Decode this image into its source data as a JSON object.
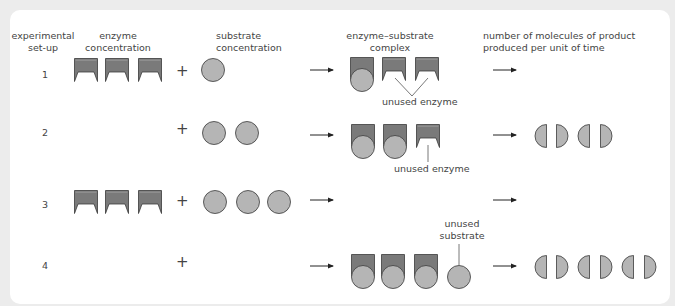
{
  "headers": {
    "setup": [
      "experimental",
      "set-up"
    ],
    "enzyme": [
      "enzyme",
      "concentration"
    ],
    "substrate": [
      "substrate",
      "concentration"
    ],
    "complex": [
      "enzyme–substrate",
      "complex"
    ],
    "product": [
      "number of molecules of product",
      "produced per unit of time"
    ]
  },
  "rows": [
    {
      "id": "1",
      "enzymes": 3,
      "substrates": 1,
      "complexes": 1,
      "unused_enzymes": 2,
      "unused_substrates": 0,
      "products": 0,
      "annotation": "unused enzyme"
    },
    {
      "id": "2",
      "enzymes": 3,
      "substrates": 2,
      "complexes": 2,
      "unused_enzymes": 1,
      "unused_substrates": 0,
      "products": 2,
      "annotation": "unused enzyme"
    },
    {
      "id": "3",
      "enzymes": 3,
      "substrates": 3,
      "complexes": 0,
      "unused_enzymes": 0,
      "unused_substrates": 0,
      "products": 0,
      "annotation": ""
    },
    {
      "id": "4",
      "enzymes": 0,
      "substrates": 0,
      "complexes": 3,
      "unused_enzymes": 0,
      "unused_substrates": 1,
      "products": 3,
      "annotation": "unused substrate"
    }
  ],
  "annotations": {
    "row1": "unused enzyme",
    "row2": "unused enzyme",
    "row4": [
      "unused",
      "substrate"
    ]
  },
  "symbols": {
    "plus": "+",
    "arrow": "arrow-right-icon"
  },
  "colors": {
    "enzyme_fill": "#7a7a7a",
    "substrate_fill": "#b5b5b5",
    "outline": "#3a3a3a",
    "background": "#ececec",
    "card": "#ffffff"
  }
}
